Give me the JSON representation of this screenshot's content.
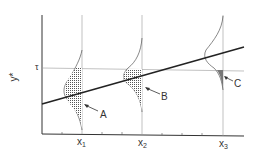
{
  "figure": {
    "y_axis_label": "y*",
    "threshold_label": "τ",
    "x_ticks": [
      {
        "label": "x",
        "sub": "1"
      },
      {
        "label": "x",
        "sub": "2"
      },
      {
        "label": "x",
        "sub": "3"
      }
    ],
    "regions": [
      {
        "label": "A"
      },
      {
        "label": "B"
      },
      {
        "label": "C"
      }
    ],
    "colors": {
      "line": "#222222",
      "shade": "#666666",
      "thin": "#777777"
    }
  }
}
